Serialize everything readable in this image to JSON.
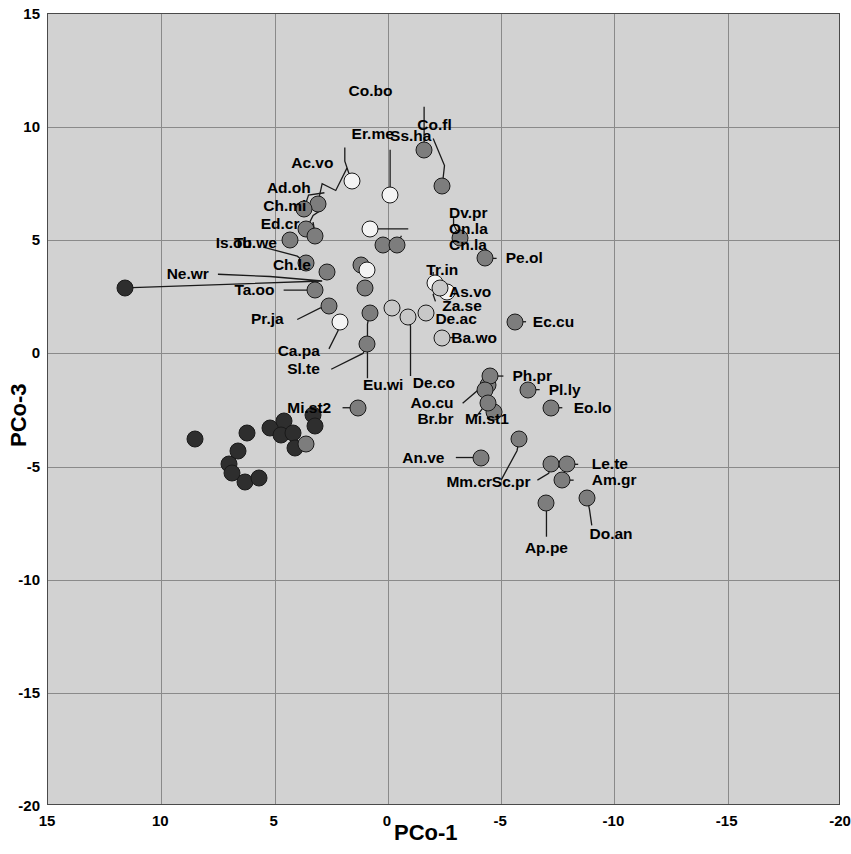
{
  "chart_data": {
    "type": "scatter",
    "title": "",
    "xlabel": "PCo-1",
    "ylabel": "PCo-3",
    "xlim": [
      15,
      -20
    ],
    "ylim": [
      -20,
      15
    ],
    "x_ticks": [
      15,
      10,
      5,
      0,
      -5,
      -10,
      -15,
      -20
    ],
    "y_ticks": [
      15,
      10,
      5,
      0,
      -5,
      -10,
      -15,
      -20
    ],
    "grid": true,
    "legend": "none",
    "axis_reversed_x": true,
    "fill_classes": {
      "dark": "#2e2e2e",
      "medium": "#7d7d7d",
      "light": "#c8c8c8",
      "white": "#f4f4f4"
    },
    "labelled_points": [
      {
        "label": "Co.bo",
        "x": -1.6,
        "y": 9.0,
        "fill": "medium"
      },
      {
        "label": "Co.fl",
        "x": -2.4,
        "y": 7.4,
        "fill": "medium"
      },
      {
        "label": "Ss.ha",
        "x": -0.1,
        "y": 7.0,
        "fill": "white"
      },
      {
        "label": "Er.me",
        "x": 1.6,
        "y": 7.6,
        "fill": "white"
      },
      {
        "label": "Ac.vo",
        "x": 3.1,
        "y": 6.6,
        "fill": "medium"
      },
      {
        "label": "Ad.oh",
        "x": 3.7,
        "y": 6.4,
        "fill": "medium"
      },
      {
        "label": "Ch.mi",
        "x": 3.6,
        "y": 5.5,
        "fill": "medium"
      },
      {
        "label": "Ed.cr",
        "x": 3.2,
        "y": 5.2,
        "fill": "medium"
      },
      {
        "label": "Dv.pr",
        "x": -3.2,
        "y": 5.1,
        "fill": "medium"
      },
      {
        "label": "On.la",
        "x": 0.8,
        "y": 5.5,
        "fill": "white"
      },
      {
        "label": "Cn.la",
        "x": -0.4,
        "y": 4.8,
        "fill": "medium"
      },
      {
        "label": "Is.ob",
        "x": 3.6,
        "y": 4.0,
        "fill": "medium"
      },
      {
        "label": "Tu.we",
        "x": 4.3,
        "y": 5.0,
        "fill": "medium"
      },
      {
        "label": "Ch.le",
        "x": 2.7,
        "y": 3.6,
        "fill": "medium"
      },
      {
        "label": "Ne.wr",
        "x": 11.6,
        "y": 2.9,
        "fill": "dark"
      },
      {
        "label": "Tr.in",
        "x": -2.1,
        "y": 3.1,
        "fill": "white"
      },
      {
        "label": "Pe.ol",
        "x": -4.3,
        "y": 4.2,
        "fill": "medium"
      },
      {
        "label": "As.vo",
        "x": -2.6,
        "y": 2.7,
        "fill": "white"
      },
      {
        "label": "Za.se",
        "x": -2.3,
        "y": 2.9,
        "fill": "light"
      },
      {
        "label": "De.ac",
        "x": -1.7,
        "y": 1.8,
        "fill": "light"
      },
      {
        "label": "Ta.oo",
        "x": 3.2,
        "y": 2.8,
        "fill": "medium"
      },
      {
        "label": "Pr.ja",
        "x": 2.6,
        "y": 2.1,
        "fill": "medium"
      },
      {
        "label": "Ca.pa",
        "x": 2.1,
        "y": 1.4,
        "fill": "white"
      },
      {
        "label": "Sl.te",
        "x": 0.9,
        "y": 0.4,
        "fill": "medium"
      },
      {
        "label": "Eu.wi",
        "x": 0.8,
        "y": 1.8,
        "fill": "medium"
      },
      {
        "label": "De.co",
        "x": -0.9,
        "y": 1.6,
        "fill": "light"
      },
      {
        "label": "Ba.wo",
        "x": -2.4,
        "y": 0.7,
        "fill": "light"
      },
      {
        "label": "Ec.cu",
        "x": -5.6,
        "y": 1.4,
        "fill": "medium"
      },
      {
        "label": "Ph.pr",
        "x": -4.5,
        "y": -1.0,
        "fill": "medium"
      },
      {
        "label": "Pl.ly",
        "x": -6.2,
        "y": -1.6,
        "fill": "medium"
      },
      {
        "label": "Eo.lo",
        "x": -7.2,
        "y": -2.4,
        "fill": "medium"
      },
      {
        "label": "Mi.st1",
        "x": -4.7,
        "y": -2.6,
        "fill": "medium"
      },
      {
        "label": "Mi.st2",
        "x": 1.3,
        "y": -2.4,
        "fill": "medium"
      },
      {
        "label": "Ao.cu",
        "x": -4.3,
        "y": -1.6,
        "fill": "medium"
      },
      {
        "label": "Br.br",
        "x": -4.4,
        "y": -2.2,
        "fill": "medium"
      },
      {
        "label": "An.ve",
        "x": -4.1,
        "y": -4.6,
        "fill": "medium"
      },
      {
        "label": "Mm.cr",
        "x": -5.8,
        "y": -3.8,
        "fill": "medium"
      },
      {
        "label": "Sc.pr",
        "x": -7.2,
        "y": -4.9,
        "fill": "medium"
      },
      {
        "label": "Le.te",
        "x": -7.9,
        "y": -4.9,
        "fill": "medium"
      },
      {
        "label": "Am.gr",
        "x": -7.7,
        "y": -5.6,
        "fill": "medium"
      },
      {
        "label": "Ap.pe",
        "x": -7.0,
        "y": -6.6,
        "fill": "medium"
      },
      {
        "label": "Do.an",
        "x": -8.8,
        "y": -6.4,
        "fill": "medium"
      }
    ],
    "unlabelled_points": [
      {
        "x": 8.5,
        "y": -3.8,
        "fill": "dark"
      },
      {
        "x": 7.0,
        "y": -4.9,
        "fill": "dark"
      },
      {
        "x": 6.9,
        "y": -5.3,
        "fill": "dark"
      },
      {
        "x": 6.3,
        "y": -5.7,
        "fill": "dark"
      },
      {
        "x": 5.7,
        "y": -5.5,
        "fill": "dark"
      },
      {
        "x": 6.6,
        "y": -4.3,
        "fill": "dark"
      },
      {
        "x": 6.2,
        "y": -3.5,
        "fill": "dark"
      },
      {
        "x": 5.2,
        "y": -3.3,
        "fill": "dark"
      },
      {
        "x": 4.6,
        "y": -3.0,
        "fill": "dark"
      },
      {
        "x": 4.7,
        "y": -3.6,
        "fill": "dark"
      },
      {
        "x": 4.2,
        "y": -3.5,
        "fill": "dark"
      },
      {
        "x": 4.1,
        "y": -4.2,
        "fill": "dark"
      },
      {
        "x": 3.3,
        "y": -2.7,
        "fill": "dark"
      },
      {
        "x": 3.2,
        "y": -3.2,
        "fill": "dark"
      },
      {
        "x": 3.6,
        "y": -4.0,
        "fill": "medium"
      },
      {
        "x": 0.2,
        "y": 4.8,
        "fill": "medium"
      },
      {
        "x": 1.2,
        "y": 3.9,
        "fill": "medium"
      },
      {
        "x": 0.9,
        "y": 3.7,
        "fill": "white"
      },
      {
        "x": 1.0,
        "y": 2.9,
        "fill": "medium"
      },
      {
        "x": -0.2,
        "y": 2.0,
        "fill": "light"
      },
      {
        "x": -4.4,
        "y": -1.4,
        "fill": "medium"
      }
    ]
  },
  "axes": {
    "x_label": "PCo-1",
    "y_label": "PCo-3",
    "x_tick_labels": [
      "15",
      "10",
      "5",
      "0",
      "-5",
      "-10",
      "-15",
      "-20"
    ],
    "y_tick_labels": [
      "15",
      "10",
      "5",
      "0",
      "-5",
      "-10",
      "-15",
      "-20"
    ]
  }
}
